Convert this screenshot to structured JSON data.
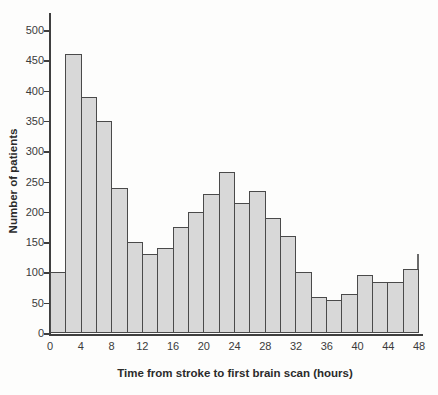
{
  "chart_data": {
    "type": "bar",
    "subtype": "histogram",
    "title": "",
    "xlabel": "Time from stroke to first brain scan (hours)",
    "ylabel": "Number of patients",
    "xlim": [
      0,
      48
    ],
    "ylim": [
      0,
      500
    ],
    "x_ticks": [
      0,
      4,
      8,
      12,
      16,
      20,
      24,
      28,
      32,
      36,
      40,
      44,
      48
    ],
    "y_ticks": [
      0,
      50,
      100,
      150,
      200,
      250,
      300,
      350,
      400,
      450,
      500
    ],
    "bin_width_hours": 2,
    "bins": [
      {
        "start": 0,
        "end": 2,
        "value": 100
      },
      {
        "start": 2,
        "end": 4,
        "value": 460
      },
      {
        "start": 4,
        "end": 6,
        "value": 390
      },
      {
        "start": 6,
        "end": 8,
        "value": 350
      },
      {
        "start": 8,
        "end": 10,
        "value": 240
      },
      {
        "start": 10,
        "end": 12,
        "value": 150
      },
      {
        "start": 12,
        "end": 14,
        "value": 130
      },
      {
        "start": 14,
        "end": 16,
        "value": 140
      },
      {
        "start": 16,
        "end": 18,
        "value": 175
      },
      {
        "start": 18,
        "end": 20,
        "value": 200
      },
      {
        "start": 20,
        "end": 22,
        "value": 230
      },
      {
        "start": 22,
        "end": 24,
        "value": 265
      },
      {
        "start": 24,
        "end": 26,
        "value": 215
      },
      {
        "start": 26,
        "end": 28,
        "value": 235
      },
      {
        "start": 28,
        "end": 30,
        "value": 190
      },
      {
        "start": 30,
        "end": 32,
        "value": 160
      },
      {
        "start": 32,
        "end": 34,
        "value": 100
      },
      {
        "start": 34,
        "end": 36,
        "value": 60
      },
      {
        "start": 36,
        "end": 38,
        "value": 55
      },
      {
        "start": 38,
        "end": 40,
        "value": 65
      },
      {
        "start": 40,
        "end": 42,
        "value": 95
      },
      {
        "start": 42,
        "end": 44,
        "value": 85
      },
      {
        "start": 44,
        "end": 46,
        "value": 85
      },
      {
        "start": 46,
        "end": 48,
        "value": 105
      }
    ],
    "artifact_spike": {
      "x_hours": 48,
      "from_value": 105,
      "to_value": 130
    },
    "grid": false,
    "legend": false
  },
  "colors": {
    "bar_fill": "#d8d8d8",
    "bar_border": "#4a4a4a",
    "axis": "#3f3f3f",
    "text": "#333333",
    "background": "#fdfdfc"
  }
}
